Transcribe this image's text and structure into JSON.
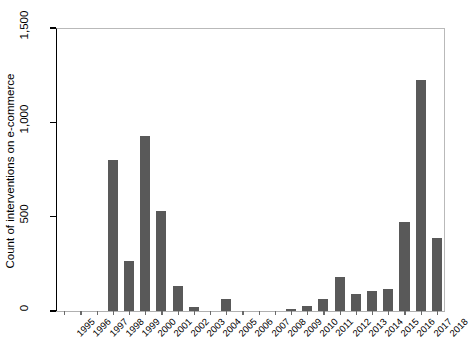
{
  "chart_data": {
    "type": "bar",
    "title": "",
    "xlabel": "",
    "ylabel": "Count of interventions on e-commerce",
    "ylim": [
      0,
      1500
    ],
    "yticks": [
      0,
      500,
      1000,
      1500
    ],
    "ytick_labels": [
      "0",
      "500",
      "1,000",
      "1,500"
    ],
    "grid": false,
    "legend": null,
    "bar_color": "#595959",
    "categories": [
      "1995",
      "1996",
      "1997",
      "1998",
      "1999",
      "2000",
      "2001",
      "2002",
      "2003",
      "2004",
      "2005",
      "2006",
      "2007",
      "2008",
      "2009",
      "2010",
      "2011",
      "2012",
      "2013",
      "2014",
      "2015",
      "2016",
      "2017",
      "2018"
    ],
    "values": [
      0,
      0,
      0,
      800,
      265,
      925,
      530,
      130,
      20,
      0,
      65,
      0,
      0,
      0,
      12,
      28,
      65,
      180,
      90,
      105,
      115,
      470,
      1225,
      385
    ]
  }
}
